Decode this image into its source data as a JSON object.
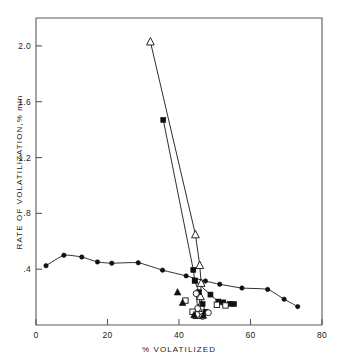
{
  "chart_data": {
    "type": "scatter",
    "title": "",
    "xlabel": "% VOLATILIZED",
    "ylabel": "RATE OF VOLATILIZATION,% min",
    "xlim": [
      0,
      80
    ],
    "ylim": [
      0,
      2.2
    ],
    "xticks": [
      0,
      20,
      40,
      60,
      80
    ],
    "xtick_labels": [
      "0",
      "20",
      "40",
      "60",
      "80"
    ],
    "yticks": [
      0.4,
      0.8,
      1.2,
      1.6,
      2.0
    ],
    "ytick_labels": [
      ".4",
      ".8",
      "1.2",
      "1.6",
      "2.0"
    ],
    "grid": false,
    "legend": "none",
    "series": [
      {
        "name": "shallow-curve-filled-circles",
        "marker": "filled-circle",
        "connected": true,
        "points": [
          [
            2.8,
            0.425
          ],
          [
            7.8,
            0.5
          ],
          [
            12.8,
            0.487
          ],
          [
            17.2,
            0.452
          ],
          [
            21.2,
            0.443
          ],
          [
            28.6,
            0.446
          ],
          [
            35.4,
            0.393
          ],
          [
            42.0,
            0.352
          ],
          [
            47.4,
            0.315
          ],
          [
            51.4,
            0.292
          ],
          [
            57.6,
            0.265
          ],
          [
            64.8,
            0.255
          ],
          [
            69.4,
            0.185
          ],
          [
            73.2,
            0.132
          ]
        ]
      },
      {
        "name": "steep-line-open-triangle",
        "marker": "open-triangle",
        "connected": true,
        "points": [
          [
            32.0,
            2.03
          ],
          [
            44.6,
            0.648
          ],
          [
            45.8,
            0.428
          ],
          [
            46.2,
            0.3
          ],
          [
            46.0,
            0.205
          ],
          [
            45.4,
            0.12
          ],
          [
            45.0,
            0.07
          ]
        ]
      },
      {
        "name": "steep-line-filled-square",
        "marker": "filled-square",
        "connected": true,
        "points": [
          [
            35.6,
            1.47
          ],
          [
            44.0,
            0.395
          ],
          [
            44.4,
            0.318
          ],
          [
            45.6,
            0.235
          ],
          [
            46.6,
            0.15
          ],
          [
            47.4,
            0.095
          ]
        ]
      },
      {
        "name": "low-cluster-filled-squares",
        "marker": "filled-square",
        "connected": true,
        "points": [
          [
            44.4,
            0.318
          ],
          [
            48.8,
            0.218
          ],
          [
            51.0,
            0.168
          ],
          [
            52.4,
            0.162
          ],
          [
            54.2,
            0.152
          ],
          [
            55.4,
            0.15
          ]
        ]
      },
      {
        "name": "low-cluster-open-circles",
        "marker": "open-circle",
        "connected": true,
        "points": [
          [
            44.8,
            0.225
          ],
          [
            45.2,
            0.118
          ],
          [
            45.0,
            0.075
          ],
          [
            46.6,
            0.062
          ],
          [
            48.2,
            0.088
          ]
        ]
      },
      {
        "name": "low-cluster-open-squares",
        "marker": "open-square",
        "connected": false,
        "points": [
          [
            41.8,
            0.175
          ],
          [
            43.8,
            0.095
          ],
          [
            50.6,
            0.145
          ],
          [
            53.0,
            0.14
          ]
        ]
      },
      {
        "name": "low-cluster-filled-triangles",
        "marker": "filled-triangle",
        "connected": false,
        "points": [
          [
            39.6,
            0.235
          ],
          [
            41.0,
            0.16
          ],
          [
            44.2,
            0.072
          ],
          [
            46.8,
            0.068
          ]
        ]
      }
    ]
  },
  "axes": {
    "x_title": "% VOLATILIZED",
    "y_title": "RATE OF VOLATILIZATION,% min"
  }
}
